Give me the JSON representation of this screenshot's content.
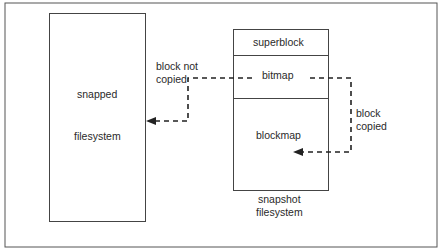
{
  "diagram": {
    "snapped_fs": {
      "line1": "snapped",
      "line2": "filesystem"
    },
    "snapshot_fs": {
      "sections": [
        "superblock",
        "bitmap",
        "blockmap"
      ],
      "caption_line1": "snapshot",
      "caption_line2": "filesystem"
    },
    "arrows": {
      "not_copied": {
        "line1": "block not",
        "line2": "copied"
      },
      "copied": {
        "line1": "block",
        "line2": "copied"
      }
    }
  }
}
